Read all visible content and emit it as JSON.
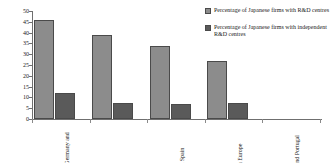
{
  "chart_data": {
    "type": "bar",
    "title": "",
    "xlabel": "",
    "ylabel": "",
    "ylim": [
      0,
      50
    ],
    "ytick_step": 5,
    "yticks": [
      "0",
      "5",
      "10",
      "15",
      "20",
      "25",
      "30",
      "35",
      "40",
      "45",
      "50"
    ],
    "grid": false,
    "legend_position": "top-right",
    "categories": [
      "France, Germany and UK",
      "Benelux",
      "Italy and Spain",
      "Northern Europe",
      "Greece and Portugal"
    ],
    "series": [
      {
        "name": "Percentage of Japanese firms with R&D centres",
        "color": "#8c8c8c",
        "values": [
          46,
          39,
          34,
          27,
          0
        ]
      },
      {
        "name": "Percentage of Japanese firms with independent R&D centres",
        "color": "#5a5a5a",
        "values": [
          12,
          7.5,
          7,
          7.5,
          0
        ]
      }
    ]
  },
  "legend": {
    "items": [
      {
        "label": "Percentage of Japanese firms with R&D centres"
      },
      {
        "label": "Percentage of Japanese firms with independent R&D centres"
      }
    ]
  }
}
